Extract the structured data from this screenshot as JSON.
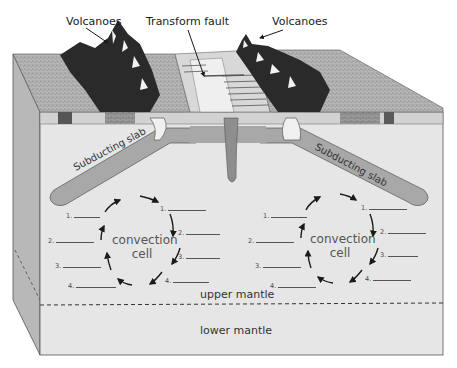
{
  "diagram": {
    "title_labels": {
      "volcanoes_left": "Volcanoes",
      "transform_fault": "Transform fault",
      "volcanoes_right": "Volcanoes"
    },
    "slabs": {
      "left": "Subducting slab",
      "right": "Subducting slab"
    },
    "cells": {
      "left": {
        "label_line1": "convection",
        "label_line2": "cell",
        "left_blanks": [
          "1.",
          "2.",
          "3.",
          "4."
        ],
        "right_blanks": [
          "1.",
          "2.",
          "3.",
          "4."
        ]
      },
      "right": {
        "label_line1": "convection",
        "label_line2": "cell",
        "left_blanks": [
          "1.",
          "2.",
          "3.",
          "4."
        ],
        "right_blanks": [
          "1.",
          "2.",
          "3.",
          "4."
        ]
      }
    },
    "layers": {
      "upper": "upper mantle",
      "lower": "lower mantle"
    },
    "colors": {
      "front_face": "#e6e6e6",
      "side_face": "#b5b5b5",
      "top_surface": "#a9a9a9",
      "slab": "#a8a8a8",
      "outline": "#555555",
      "arrow": "#1a1a1a",
      "volcano": "#2a2a2a",
      "rift": "#d8d8d8"
    }
  }
}
